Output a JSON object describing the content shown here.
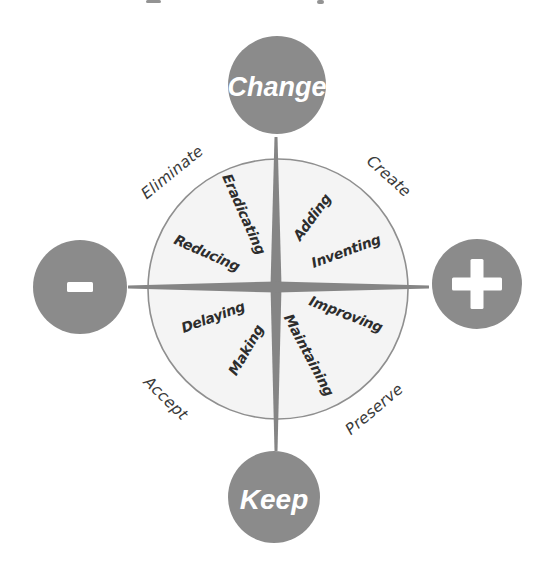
{
  "diagram": {
    "poles": {
      "top": {
        "label": "Change"
      },
      "bottom": {
        "label": "Keep"
      },
      "left": {
        "symbol": "-"
      },
      "right": {
        "symbol": "+"
      }
    },
    "outer_labels": {
      "top_left": "Eliminate",
      "top_right": "Create",
      "bottom_left": "Accept",
      "bottom_right": "Preserve"
    },
    "inner_words": {
      "top_left": "Eradicating",
      "top_right": "Adding",
      "left_upper": "Reducing",
      "right_upper": "Inventing",
      "left_lower": "Delaying",
      "right_lower": "Improving",
      "bottom_left": "Making",
      "bottom_right": "Maintaining"
    },
    "colors": {
      "node_gray": "#8b8b8b",
      "needle_gray": "#858585",
      "disc_fill": "#f4f4f4",
      "disc_stroke": "#8f8f8f",
      "inner_text": "#2d2d2d",
      "outer_text": "#3a3a3a",
      "pole_text": "#ffffff"
    }
  }
}
